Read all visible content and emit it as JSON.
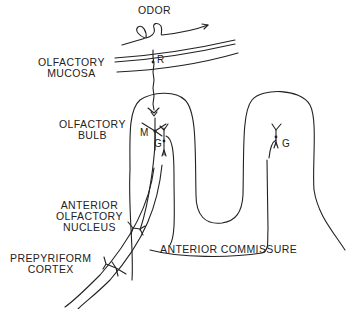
{
  "diagram": {
    "labels": {
      "odor": "ODOR",
      "mucosa_line1": "OLFACTORY",
      "mucosa_line2": "MUCOSA",
      "bulb_line1": "OLFACTORY",
      "bulb_line2": "BULB",
      "aon_line1": "ANTERIOR",
      "aon_line2": "OLFACTORY",
      "aon_line3": "NUCLEUS",
      "prepyriform_line1": "PREPYRIFORM",
      "prepyriform_line2": "CORTEX",
      "commissure": "ANTERIOR COMMISSURE"
    },
    "cell_markers": {
      "receptor": "R",
      "mitral": "M",
      "granule_left": "G",
      "granule_right": "G"
    },
    "stroke_color": "#222222",
    "background_color": "#ffffff"
  }
}
